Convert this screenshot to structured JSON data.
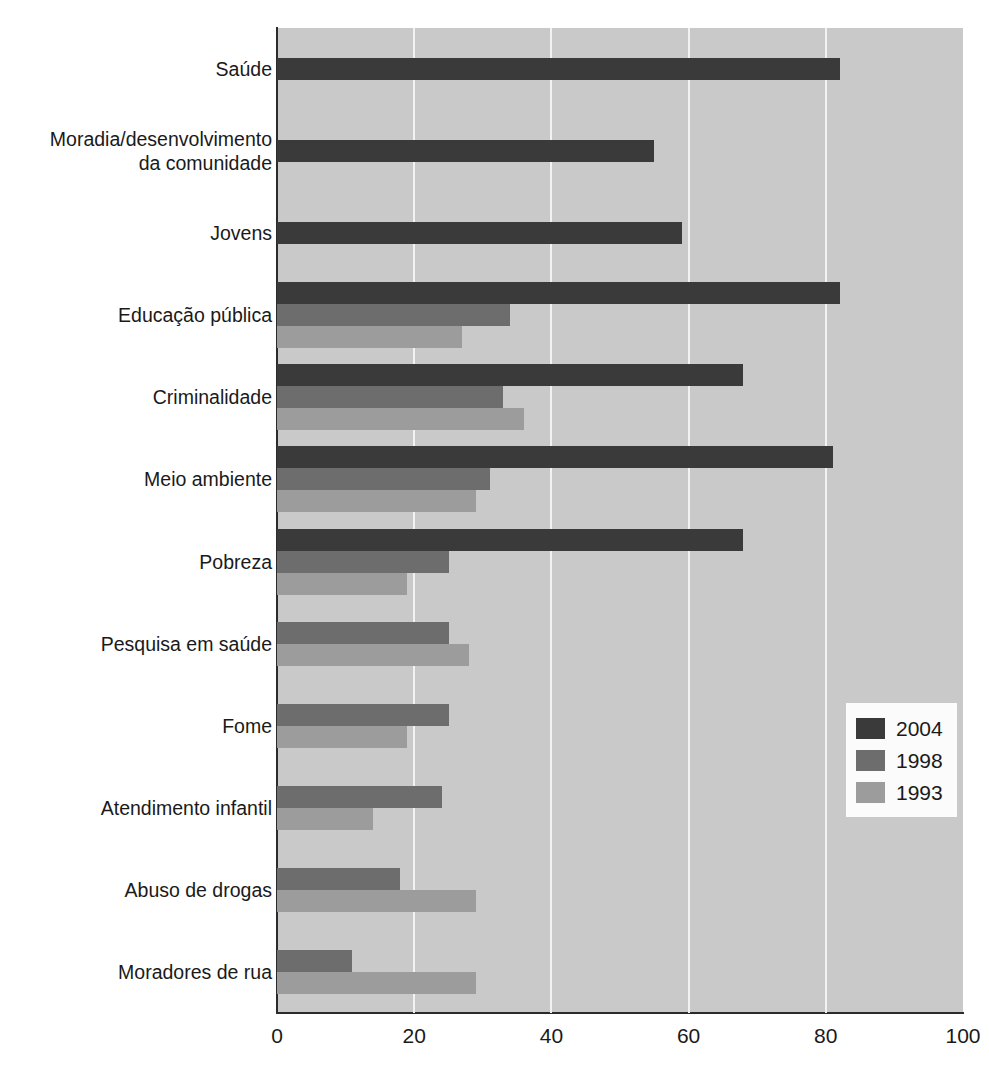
{
  "chart_data": {
    "type": "bar",
    "orientation": "horizontal",
    "title": "",
    "subtitle": "",
    "xlabel": "",
    "ylabel": "",
    "xlim": [
      0,
      100
    ],
    "xticks": [
      "0",
      "20",
      "40",
      "60",
      "80",
      "100"
    ],
    "xtick_values": [
      0,
      20,
      40,
      60,
      80,
      100
    ],
    "grid": "vertical",
    "legend_position": "center-right",
    "categories": [
      "Saúde",
      "Moradia/desenvolvimento\nda comunidade",
      "Jovens",
      "Educação pública",
      "Criminalidade",
      "Meio ambiente",
      "Pobreza",
      "Pesquisa em saúde",
      "Fome",
      "Atendimento infantil",
      "Abuso de drogas",
      "Moradores de rua"
    ],
    "series": [
      {
        "name": "2004",
        "color": "#3a3a3a",
        "values": [
          82,
          55,
          59,
          82,
          68,
          81,
          68,
          null,
          null,
          null,
          null,
          null
        ]
      },
      {
        "name": "1998",
        "color": "#6d6d6d",
        "values": [
          null,
          null,
          null,
          34,
          33,
          31,
          25,
          25,
          25,
          24,
          18,
          11
        ]
      },
      {
        "name": "1993",
        "color": "#9c9c9c",
        "values": [
          null,
          null,
          null,
          27,
          36,
          29,
          19,
          28,
          19,
          14,
          29,
          29
        ]
      }
    ],
    "legend": [
      "2004",
      "1998",
      "1993"
    ],
    "plot_background": "#c9c9c9",
    "gridline_color": "#f2f2f2",
    "axis_color": "#2b2b2b"
  }
}
